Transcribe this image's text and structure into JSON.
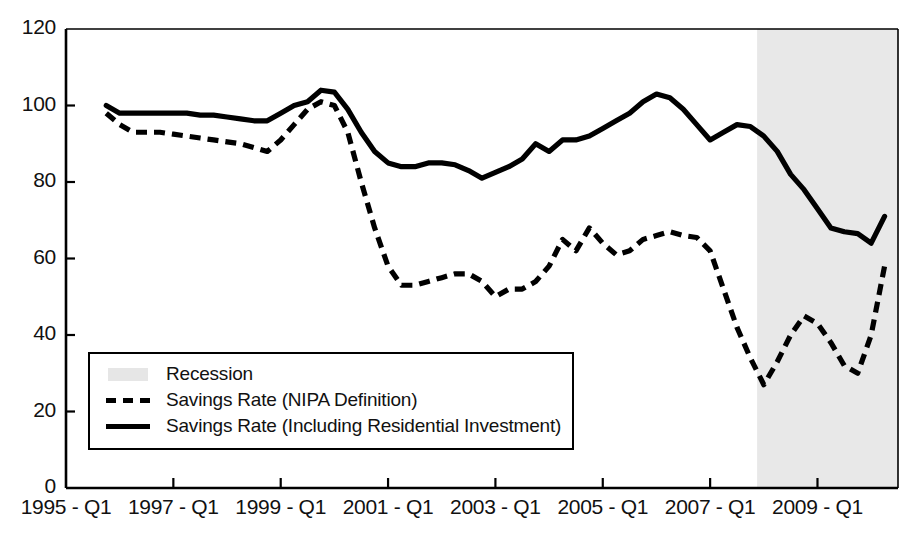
{
  "chart_data": {
    "type": "line",
    "title": "",
    "xlabel": "",
    "ylabel": "",
    "ylim": [
      0,
      120
    ],
    "ytick_values": [
      0,
      20,
      40,
      60,
      80,
      100,
      120
    ],
    "ytick_labels": [
      "0",
      "20",
      "40",
      "60",
      "80",
      "100",
      "120"
    ],
    "xtick_labels": [
      "1995 - Q1",
      "1997 - Q1",
      "1999 - Q1",
      "2001 - Q1",
      "2003 - Q1",
      "2005 - Q1",
      "2007 - Q1",
      "2009 - Q1"
    ],
    "xtick_quarters": [
      0,
      8,
      16,
      24,
      32,
      40,
      48,
      56
    ],
    "xlim_quarters": [
      0,
      62
    ],
    "grid": false,
    "legend_position": "lower-left-inside",
    "series": [
      {
        "name": "Savings Rate (NIPA Definition)",
        "style": "dashed",
        "color": "#000000",
        "x_quarters": [
          3,
          4,
          5,
          6,
          7,
          8,
          9,
          10,
          11,
          12,
          13,
          14,
          15,
          16,
          17,
          18,
          19,
          20,
          21,
          22,
          23,
          24,
          25,
          26,
          27,
          28,
          29,
          30,
          31,
          32,
          33,
          34,
          35,
          36,
          37,
          38,
          39,
          40,
          41,
          42,
          43,
          44,
          45,
          46,
          47,
          48,
          49,
          50,
          51,
          52,
          53,
          54,
          55,
          56,
          57,
          58,
          59,
          60,
          61
        ],
        "values": [
          98,
          95,
          93,
          93,
          93,
          92.5,
          92,
          91.5,
          91,
          90.5,
          90,
          89,
          88,
          91,
          95,
          99,
          101,
          100,
          93,
          80,
          68,
          58,
          53,
          53,
          54,
          55,
          56,
          56,
          54,
          50,
          52,
          52,
          54,
          58,
          65,
          62,
          68,
          64,
          61,
          62,
          65,
          66,
          67,
          66,
          65.5,
          62,
          52,
          42,
          34,
          27,
          33,
          40,
          45,
          43,
          38,
          32,
          30,
          40,
          58
        ]
      },
      {
        "name": "Savings Rate (Including Residential Investment)",
        "style": "solid",
        "color": "#000000",
        "x_quarters": [
          3,
          4,
          5,
          6,
          7,
          8,
          9,
          10,
          11,
          12,
          13,
          14,
          15,
          16,
          17,
          18,
          19,
          20,
          21,
          22,
          23,
          24,
          25,
          26,
          27,
          28,
          29,
          30,
          31,
          32,
          33,
          34,
          35,
          36,
          37,
          38,
          39,
          40,
          41,
          42,
          43,
          44,
          45,
          46,
          47,
          48,
          49,
          50,
          51,
          52,
          53,
          54,
          55,
          56,
          57,
          58,
          59,
          60,
          61
        ],
        "values": [
          100,
          98,
          98,
          98,
          98,
          98,
          98,
          97.5,
          97.5,
          97,
          96.5,
          96,
          96,
          98,
          100,
          101,
          104,
          103.5,
          99,
          93,
          88,
          85,
          84,
          84,
          85,
          85,
          84.5,
          83,
          81,
          82.5,
          84,
          86,
          90,
          88,
          91,
          91,
          92,
          94,
          96,
          98,
          101,
          103,
          102,
          99,
          95,
          91,
          93,
          95,
          94.5,
          92,
          88,
          82,
          78,
          73,
          68,
          67,
          66.5,
          64,
          71
        ]
      }
    ],
    "recession_bands": [
      {
        "label": "Recession",
        "start_quarter": 51.5,
        "end_quarter": 62
      }
    ],
    "annotations": []
  },
  "legend": {
    "items": [
      {
        "label": "Recession",
        "key": "shaded-swatch"
      },
      {
        "label": "Savings Rate (NIPA Definition)",
        "key": "dashed-line"
      },
      {
        "label": "Savings Rate (Including Residential Investment)",
        "key": "solid-line"
      }
    ]
  },
  "colors": {
    "axis": "#000000",
    "series_line": "#000000",
    "recession_shade": "#e8e8e8",
    "background": "#ffffff"
  }
}
